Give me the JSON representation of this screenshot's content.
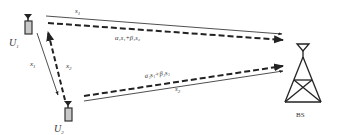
{
  "diagram": {
    "type": "cooperative-relay-network",
    "nodes": {
      "u1": {
        "label": "U",
        "sub": "1"
      },
      "u2": {
        "label": "U",
        "sub": "2"
      },
      "bs": {
        "label": "BS"
      }
    },
    "links": {
      "u1_to_bs_solid": {
        "label": "s",
        "sub": "1"
      },
      "u1_to_bs_dashed": {
        "label": "α₁s₁+β₁s₂"
      },
      "u2_to_bs_dashed": {
        "label": "α₂s₁+β₂s₂"
      },
      "u2_to_bs_solid": {
        "label": "s",
        "sub": "2"
      },
      "u1_to_u2_solid": {
        "label": "x",
        "sub": "1"
      },
      "u2_to_u1_dashed": {
        "label": "x",
        "sub": "2"
      }
    },
    "colors": {
      "line": "#222222",
      "device_fill": "#c8c8c8",
      "device_stroke": "#333333",
      "text": "#333333"
    }
  }
}
